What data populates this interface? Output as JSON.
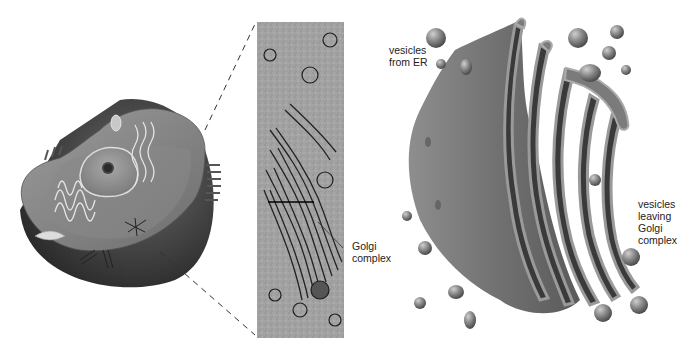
{
  "figure": {
    "panels": [
      {
        "id": "cell",
        "description": "cutaway illustration of animal cell"
      },
      {
        "id": "micrograph",
        "description": "electron micrograph of Golgi complex"
      },
      {
        "id": "golgi_3d",
        "description": "3D illustration of Golgi complex stacks"
      }
    ],
    "labels": {
      "golgi_complex": "Golgi\ncomplex",
      "vesicles_from_er": "vesicles\nfrom ER",
      "vesicles_leaving": "vesicles\nleaving\nGolgi\ncomplex"
    },
    "colors": {
      "cell_dark": "#3a3a3a",
      "cell_mid": "#7a7a7a",
      "cell_light": "#b5b5b5",
      "micrograph_bg": "#a9a9a9",
      "golgi_body": "#7d7d7d",
      "golgi_shadow": "#3d3d3d",
      "label_text": "#222222"
    }
  }
}
